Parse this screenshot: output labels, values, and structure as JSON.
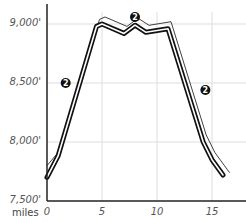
{
  "chart_data": {
    "type": "line",
    "title": "",
    "xlabel": "miles",
    "ylabel": "",
    "x_ticks": [
      "0",
      "5",
      "10",
      "15"
    ],
    "y_ticks": [
      "7,500'",
      "8,000'",
      "8,500'",
      "9,000'"
    ],
    "xlim": [
      0,
      18
    ],
    "ylim": [
      7500,
      9100
    ],
    "grid": true,
    "series": [
      {
        "name": "elevation profile",
        "x": [
          0,
          1,
          4.5,
          5,
          7,
          8,
          9,
          11,
          14.2,
          15,
          16
        ],
        "y": [
          7700,
          7880,
          8980,
          9000,
          8920,
          8990,
          8930,
          8960,
          8000,
          7850,
          7720
        ]
      }
    ],
    "annotations": [
      {
        "label": "2",
        "x": 1.7,
        "y": 8500
      },
      {
        "label": "2",
        "x": 8,
        "y": 9060
      },
      {
        "label": "2",
        "x": 14.4,
        "y": 8440
      }
    ]
  },
  "axis": {
    "unit_label": "miles"
  },
  "colors": {
    "line": "#111111",
    "grid": "#dddddd",
    "axis": "#222222",
    "marker": "#111111"
  }
}
